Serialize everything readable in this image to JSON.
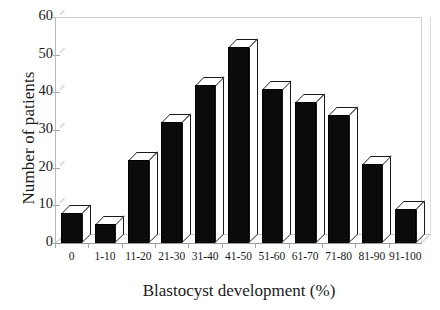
{
  "chart_data": {
    "type": "bar",
    "title": "",
    "xlabel": "Blastocyst development (%)",
    "ylabel": "Number of patients",
    "categories": [
      "0",
      "1-10",
      "11-20",
      "21-30",
      "31-40",
      "41-50",
      "51-60",
      "61-70",
      "71-80",
      "81-90",
      "91-100"
    ],
    "values": [
      8,
      5,
      22,
      32,
      42,
      52,
      41,
      37.5,
      34,
      21,
      9
    ],
    "ylim": [
      0,
      60
    ],
    "yticks": [
      0,
      10,
      20,
      30,
      40,
      50,
      60
    ],
    "ytick_labels": [
      "0",
      "10",
      "20",
      "30",
      "40",
      "50",
      "60"
    ],
    "grid": false,
    "legend": null,
    "bar_style": "3d-extruded",
    "bar_face_color": "#0b0b0b",
    "bar_top_color": "#ffffff",
    "frame_color": "#c4c4c4"
  }
}
